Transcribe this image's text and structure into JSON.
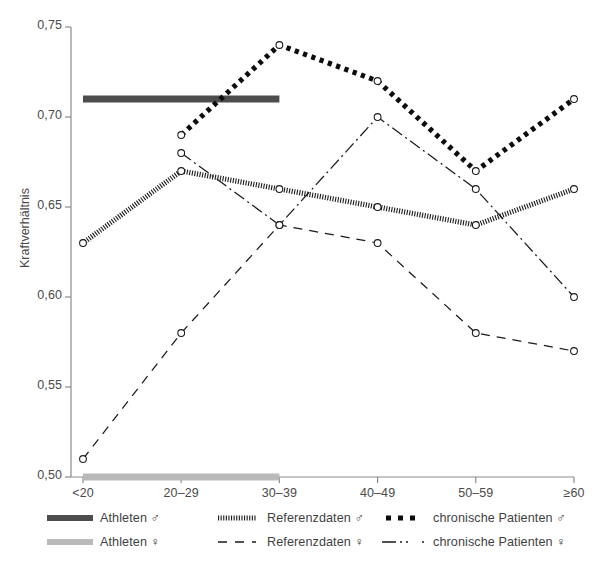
{
  "figure": {
    "width": 598,
    "height": 573,
    "background": "#ffffff"
  },
  "axis": {
    "ylabel": "Kraftverhältnis",
    "yticks": [
      "0,75",
      "0,70",
      "0,65",
      "0,60",
      "0,55",
      "0,50"
    ],
    "ytick_values": [
      0.75,
      0.7,
      0.65,
      0.6,
      0.55,
      0.5
    ],
    "xticks": [
      "<20",
      "20–29",
      "30–39",
      "40–49",
      "50–59",
      "≥60"
    ],
    "axis_color": "#8c8c8c"
  },
  "legend": {
    "items": [
      {
        "key": "athleten-m",
        "label": "Athleten ♂",
        "style": "thick-solid-dark",
        "color": "#4d4d4d"
      },
      {
        "key": "athleten-w",
        "label": "Athleten ♀",
        "style": "thick-solid-light",
        "color": "#b9b9b9"
      },
      {
        "key": "referenz-m",
        "label": "Referenzdaten ♂",
        "style": "hatched",
        "color": "#1a1a1a"
      },
      {
        "key": "referenz-w",
        "label": "Referenzdaten ♀",
        "style": "dashed",
        "color": "#1a1a1a"
      },
      {
        "key": "chronische-m",
        "label": "chronische Patienten ♂",
        "style": "thick-dashed",
        "color": "#0d0d0d"
      },
      {
        "key": "chronische-w",
        "label": "chronische Patienten ♀",
        "style": "dash-dot",
        "color": "#1a1a1a"
      }
    ]
  },
  "caption": {
    "text": ""
  },
  "chart_data": {
    "type": "line",
    "title": "",
    "xlabel": "",
    "ylabel": "Kraftverhältnis",
    "categories": [
      "<20",
      "20–29",
      "30–39",
      "40–49",
      "50–59",
      "≥60"
    ],
    "ylim": [
      0.5,
      0.75
    ],
    "yticks": [
      0.5,
      0.55,
      0.6,
      0.65,
      0.7,
      0.75
    ],
    "grid": false,
    "legend_position": "below-axes",
    "series": [
      {
        "name": "Athleten ♂",
        "style": "thick-solid-dark",
        "color": "#4d4d4d",
        "kind": "reference-band",
        "constant_value": 0.71,
        "x_from": "<20",
        "x_to": "30–39",
        "values": [
          0.71,
          0.71,
          0.71,
          null,
          null,
          null
        ],
        "markers": false
      },
      {
        "name": "Athleten ♀",
        "style": "thick-solid-light",
        "color": "#b9b9b9",
        "kind": "reference-band",
        "constant_value": 0.5,
        "x_from": "<20",
        "x_to": "30–39",
        "values": [
          0.5,
          0.5,
          0.5,
          null,
          null,
          null
        ],
        "markers": false
      },
      {
        "name": "Referenzdaten ♂",
        "style": "hatched",
        "color": "#1a1a1a",
        "values": [
          0.63,
          0.67,
          0.66,
          0.65,
          0.64,
          0.66
        ],
        "markers": true
      },
      {
        "name": "Referenzdaten ♀",
        "style": "dashed",
        "color": "#1a1a1a",
        "values": [
          0.51,
          0.58,
          0.64,
          0.63,
          0.58,
          0.57
        ],
        "markers": true
      },
      {
        "name": "chronische Patienten ♂",
        "style": "thick-dashed",
        "color": "#0d0d0d",
        "values": [
          null,
          0.69,
          0.74,
          0.72,
          0.67,
          0.71
        ],
        "markers": true
      },
      {
        "name": "chronische Patienten ♀",
        "style": "dash-dot",
        "color": "#1a1a1a",
        "values": [
          null,
          0.68,
          0.64,
          0.7,
          0.66,
          0.6
        ],
        "markers": true
      }
    ]
  }
}
